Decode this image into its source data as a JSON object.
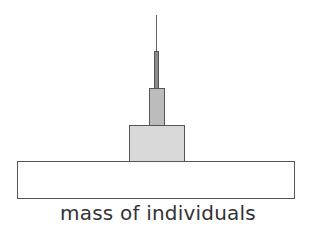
{
  "diagram": {
    "type": "pyramid",
    "caption": "mass of individuals",
    "tiers": [
      {
        "level": 1,
        "name": "base",
        "fill": "#ffffff"
      },
      {
        "level": 2,
        "name": "second",
        "fill": "#d9d9d9"
      },
      {
        "level": 3,
        "name": "third",
        "fill": "#bcbcbc"
      },
      {
        "level": 4,
        "name": "fourth",
        "fill": "#8a8a8a"
      },
      {
        "level": 5,
        "name": "apex-line",
        "fill": "#666666"
      }
    ]
  }
}
